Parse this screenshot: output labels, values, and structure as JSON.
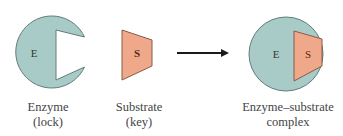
{
  "diagram": {
    "colors": {
      "enzyme_fill": "#a9cbc7",
      "enzyme_stroke": "#5e7e7a",
      "substrate_fill": "#f0a88a",
      "substrate_stroke": "#8a5a48",
      "arrow": "#1a1a1a",
      "text": "#444444"
    },
    "enzyme": {
      "symbol": "E",
      "label_line1": "Enzyme",
      "label_line2": "(lock)"
    },
    "substrate": {
      "symbol": "S",
      "label_line1": "Substrate",
      "label_line2": "(key)"
    },
    "complex": {
      "enzyme_symbol": "E",
      "substrate_symbol": "S",
      "label_line1": "Enzyme–substrate",
      "label_line2": "complex"
    },
    "arrow": {
      "direction": "right"
    }
  }
}
